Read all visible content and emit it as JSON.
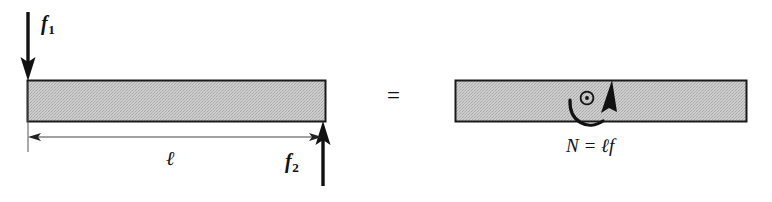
{
  "figure": {
    "domain": "diagram",
    "background_color": "#ffffff",
    "ink_color": "#111111",
    "bar_fill_color": "#c3c3c3",
    "bar_stroke_color": "#1a1a1a"
  },
  "left_panel": {
    "name": "force-pair-beam",
    "bar": {
      "label": "beam",
      "x": 27,
      "y": 80,
      "width": 299,
      "height": 42
    },
    "force_down": {
      "label_text": "f",
      "subscript": "1",
      "direction": "down",
      "applied_at": "left-end-top"
    },
    "force_up": {
      "label_text": "f",
      "subscript": "2",
      "direction": "up",
      "applied_at": "right-end-bottom"
    },
    "dimension": {
      "label_text": "ℓ",
      "description": "length between the two forces",
      "arrow_style": "double-headed"
    }
  },
  "equals": {
    "symbol": "=",
    "meaning": "statically equivalent to"
  },
  "right_panel": {
    "name": "couple-moment-beam",
    "bar": {
      "label": "beam",
      "x": 455,
      "y": 80,
      "width": 292,
      "height": 42
    },
    "moment": {
      "equation": "N = ℓf",
      "symbol_name": "out-of-plane-vector",
      "rotation_sense": "counterclockwise",
      "glyph": "circle-with-dot"
    }
  }
}
